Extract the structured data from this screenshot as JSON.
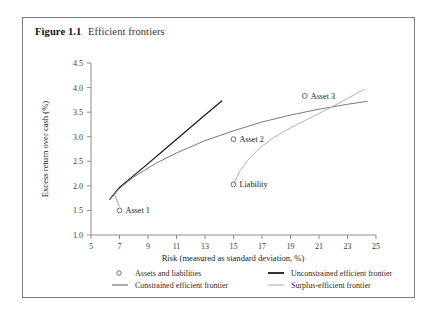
{
  "figure": {
    "label": "Figure",
    "number": "1.1",
    "title": "Efficient frontiers"
  },
  "chart_data": {
    "type": "line",
    "title": "Efficient frontiers",
    "xlabel": "Risk (measured as standard deviation, %)",
    "ylabel": "Excess return over cash (%)",
    "xlim": [
      5,
      25
    ],
    "ylim": [
      1.0,
      4.5
    ],
    "xticks": [
      5,
      7,
      9,
      11,
      13,
      15,
      17,
      19,
      21,
      23,
      25
    ],
    "yticks": [
      1.0,
      1.5,
      2.0,
      2.5,
      3.0,
      3.5,
      4.0,
      4.5
    ],
    "xtick_labels": [
      "5",
      "7",
      "9",
      "11",
      "13",
      "15",
      "17",
      "19",
      "21",
      "23",
      "25"
    ],
    "ytick_labels": [
      "1.0",
      "1.5",
      "2.0",
      "2.5",
      "3.0",
      "3.5",
      "4.0",
      "4.5"
    ],
    "grid": false,
    "legend_position": "below-axes",
    "series": [
      {
        "name": "Unconstrained efficient frontier",
        "style": "solid",
        "color": "#1b1b1b",
        "points": [
          [
            6.3,
            1.72
          ],
          [
            7.0,
            1.97
          ],
          [
            8.5,
            2.33
          ],
          [
            10.0,
            2.7
          ],
          [
            11.5,
            3.07
          ],
          [
            13.0,
            3.44
          ],
          [
            14.2,
            3.73
          ]
        ]
      },
      {
        "name": "Constrained efficient frontier",
        "style": "solid",
        "color": "#7a7a7a",
        "points": [
          [
            6.3,
            1.72
          ],
          [
            7.0,
            1.95
          ],
          [
            8.0,
            2.18
          ],
          [
            9.5,
            2.45
          ],
          [
            11.0,
            2.67
          ],
          [
            13.0,
            2.92
          ],
          [
            15.0,
            3.12
          ],
          [
            17.0,
            3.3
          ],
          [
            19.0,
            3.44
          ],
          [
            21.0,
            3.56
          ],
          [
            23.0,
            3.66
          ],
          [
            24.4,
            3.72
          ]
        ]
      },
      {
        "name": "Surplus-efficient frontier",
        "style": "solid",
        "color": "#b3b3b3",
        "points": [
          [
            15.0,
            2.02
          ],
          [
            15.4,
            2.28
          ],
          [
            16.0,
            2.52
          ],
          [
            16.8,
            2.76
          ],
          [
            17.8,
            2.98
          ],
          [
            19.0,
            3.18
          ],
          [
            20.5,
            3.4
          ],
          [
            22.0,
            3.62
          ],
          [
            23.4,
            3.84
          ],
          [
            24.2,
            3.97
          ]
        ]
      }
    ],
    "scatter": {
      "name": "Assets and liabilities",
      "marker": "open-circle",
      "color": "#5c5c5c",
      "points": [
        {
          "label": "Asset 1",
          "x": 7.0,
          "y": 1.5
        },
        {
          "label": "Asset 2",
          "x": 15.0,
          "y": 2.95
        },
        {
          "label": "Asset 3",
          "x": 20.0,
          "y": 3.83
        },
        {
          "label": "Liability",
          "x": 15.0,
          "y": 2.03
        }
      ]
    },
    "annotations": [
      {
        "type": "leader-line",
        "from": [
          7.0,
          1.58
        ],
        "to": [
          6.6,
          1.85
        ]
      }
    ]
  },
  "legend": {
    "items": [
      {
        "label": "Assets and liabilities",
        "glyph": "open-circle-icon",
        "color": "#5c5c5c"
      },
      {
        "label": "Unconstrained efficient frontier",
        "glyph": "line-swatch-icon",
        "color": "#1b1b1b"
      },
      {
        "label": "Constrained efficient frontier",
        "glyph": "line-swatch-icon",
        "color": "#7a7a7a"
      },
      {
        "label": "Surplus-efficient frontier",
        "glyph": "line-swatch-icon",
        "color": "#b3b3b3"
      }
    ]
  }
}
